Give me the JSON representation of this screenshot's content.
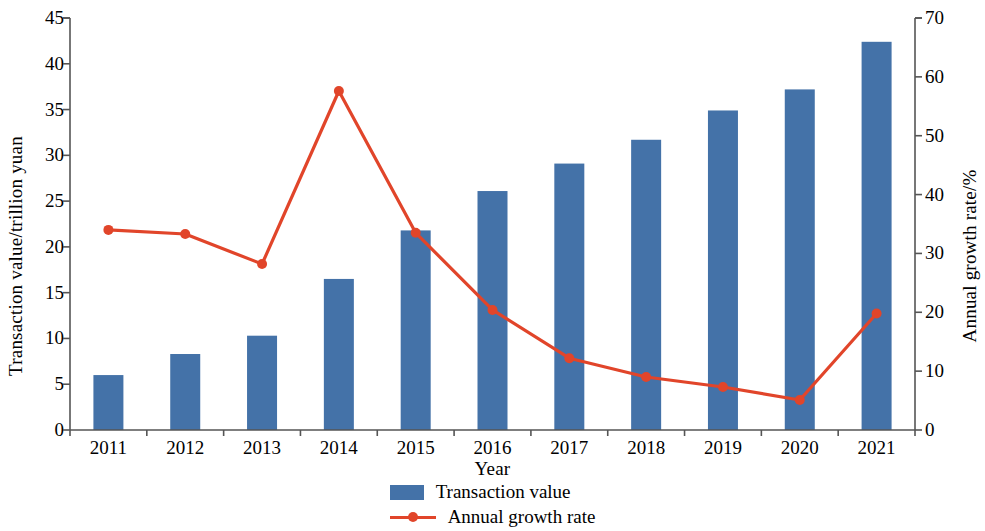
{
  "chart_data": {
    "type": "bar",
    "title": "",
    "xlabel": "Year",
    "ylabel": "Transaction value/trillion yuan",
    "y2label": "Annual growth rate/%",
    "categories": [
      "2011",
      "2012",
      "2013",
      "2014",
      "2015",
      "2016",
      "2017",
      "2018",
      "2019",
      "2020",
      "2021"
    ],
    "ylim": [
      0,
      45
    ],
    "y2lim": [
      0,
      70
    ],
    "yticks": [
      0,
      5,
      10,
      15,
      20,
      25,
      30,
      35,
      40,
      45
    ],
    "y2ticks": [
      0,
      10,
      20,
      30,
      40,
      50,
      60,
      70
    ],
    "grid": false,
    "legend_position": "bottom-center",
    "series": [
      {
        "name": "Transaction value",
        "type": "bar",
        "axis": "left",
        "color": "#4472a8",
        "values": [
          6.0,
          8.3,
          10.3,
          16.5,
          21.8,
          26.1,
          29.1,
          31.7,
          34.9,
          37.2,
          42.4
        ]
      },
      {
        "name": "Annual growth rate",
        "type": "line",
        "axis": "right",
        "color": "#e1452a",
        "marker": "circle",
        "values": [
          34.0,
          33.3,
          28.2,
          57.6,
          33.5,
          20.4,
          12.2,
          9.0,
          7.3,
          5.1,
          19.8
        ]
      }
    ]
  },
  "legend": {
    "items": [
      {
        "label": "Transaction value",
        "swatch": "bar-swatch",
        "color": "#4472a8"
      },
      {
        "label": "Annual growth rate",
        "swatch": "line-swatch",
        "color": "#e1452a"
      }
    ]
  },
  "colors": {
    "bar": "#4472a8",
    "line": "#e1452a",
    "axis": "#555555",
    "text": "#000000",
    "background": "#ffffff"
  }
}
